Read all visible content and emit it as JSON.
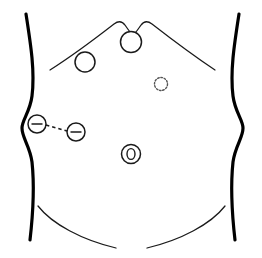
{
  "figure": {
    "width": 262,
    "height": 258,
    "background_color": "#ffffff",
    "stroke_color": "#000000",
    "line_color": "#1a1a1a",
    "dotted_color": "#555555"
  },
  "body_outline": {
    "left_flank": {
      "name": "left-torso-contour",
      "path": "M 26 14 C 31 46 35 72 32 96 C 30 112 22 120 22 128 C 22 138 30 146 32 162 C 35 190 33 214 30 240"
    },
    "right_flank": {
      "name": "right-torso-contour",
      "path": "M 239 14 C 234 46 230 72 233 96 C 235 112 243 120 243 128 C 243 138 235 146 233 162 C 230 190 232 214 235 240"
    }
  },
  "landmarks": [
    {
      "name": "costal-margin-left",
      "label": "Left costal margin",
      "path": "M 50 70 C 72 56 96 38 114 24 C 118 21 122 21 125 25 C 127 28 129 31 131 33"
    },
    {
      "name": "costal-margin-right",
      "label": "Right costal margin",
      "path": "M 215 70 C 194 56 170 38 152 24 C 148 21 144 21 141 25 C 139 28 137 31 135 33"
    },
    {
      "name": "inguinal-crease-left",
      "label": "Left inguinal crease",
      "path": "M 38 206 C 52 224 82 240 116 248"
    },
    {
      "name": "inguinal-crease-right",
      "label": "Right inguinal crease",
      "path": "M 225 206 C 211 224 181 240 147 248"
    }
  ],
  "markers": [
    {
      "name": "port-xiphoid",
      "label": "Xiphoid port",
      "style": "open-circle",
      "cx": 131,
      "cy": 42,
      "r": 10.5
    },
    {
      "name": "port-left-upper-quadrant",
      "label": "Left upper quadrant port",
      "style": "open-circle",
      "cx": 85,
      "cy": 62,
      "r": 10.0
    },
    {
      "name": "port-right-paraumbilical-planned",
      "label": "Planned right paraumbilical port",
      "style": "dotted-circle",
      "cx": 161,
      "cy": 84,
      "r": 6.5
    },
    {
      "name": "port-flank-lateral",
      "label": "Lateral flank port",
      "style": "circle-with-bar",
      "cx": 37,
      "cy": 124,
      "r": 9.0,
      "bar_half_width": 5.5
    },
    {
      "name": "port-flank-medial",
      "label": "Medial flank port",
      "style": "circle-with-bar",
      "cx": 76,
      "cy": 132,
      "r": 9.0,
      "bar_half_width": 5.5
    },
    {
      "name": "port-umbilical",
      "label": "Umbilical port",
      "style": "double-ring",
      "cx": 131,
      "cy": 154,
      "r_outer": 9.5,
      "r_inner_rx": 4.0,
      "r_inner_ry": 5.4
    }
  ],
  "connectors": [
    {
      "name": "flank-port-connector",
      "label": "Dashed connector between flank ports",
      "x1": 46,
      "y1": 125,
      "x2": 67,
      "y2": 131,
      "style": "dashed"
    }
  ]
}
